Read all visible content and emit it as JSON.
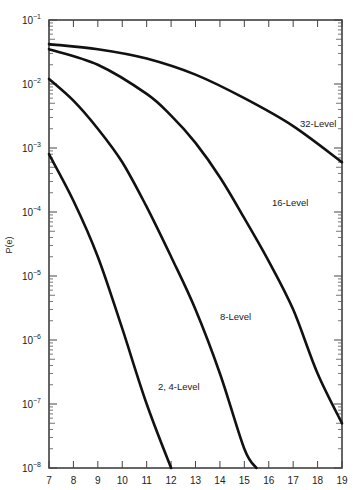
{
  "chart_data": {
    "type": "line",
    "title": "",
    "xlabel": "",
    "ylabel": "P(e)",
    "xlim": [
      7,
      19
    ],
    "ylim": [
      1e-08,
      0.1
    ],
    "yscale": "log",
    "grid": false,
    "x_ticks": [
      "7",
      "8",
      "9",
      "10",
      "11",
      "12",
      "13",
      "14",
      "15",
      "16",
      "17",
      "18",
      "19"
    ],
    "y_ticks": [
      {
        "base": "10",
        "exp": "−1",
        "value": -1
      },
      {
        "base": "10",
        "exp": "−2",
        "value": -2
      },
      {
        "base": "10",
        "exp": "−3",
        "value": -3
      },
      {
        "base": "10",
        "exp": "−4",
        "value": -4
      },
      {
        "base": "10",
        "exp": "−5",
        "value": -5
      },
      {
        "base": "10",
        "exp": "−6",
        "value": -6
      },
      {
        "base": "10",
        "exp": "−7",
        "value": -7
      },
      {
        "base": "10",
        "exp": "−8",
        "value": -8
      }
    ],
    "series": [
      {
        "name": "32-Level",
        "label_pos": [
          300,
          127
        ],
        "points": [
          [
            7,
            0.042
          ],
          [
            9,
            0.035
          ],
          [
            11,
            0.025
          ],
          [
            13,
            0.014
          ],
          [
            15,
            0.006
          ],
          [
            17,
            0.0022
          ],
          [
            19,
            0.0006
          ]
        ]
      },
      {
        "name": "16-Level",
        "label_pos": [
          272,
          206
        ],
        "points": [
          [
            7,
            0.035
          ],
          [
            9,
            0.02
          ],
          [
            11,
            0.007
          ],
          [
            12,
            0.0032
          ],
          [
            13,
            0.0012
          ],
          [
            14,
            0.00035
          ],
          [
            15,
            8e-05
          ],
          [
            16,
            1.7e-05
          ],
          [
            17,
            3e-06
          ],
          [
            18,
            3e-07
          ],
          [
            19,
            5e-08
          ]
        ]
      },
      {
        "name": "8-Level",
        "label_pos": [
          220,
          320
        ],
        "points": [
          [
            7,
            0.012
          ],
          [
            8,
            0.0055
          ],
          [
            9,
            0.002
          ],
          [
            10,
            0.0006
          ],
          [
            11,
            0.00012
          ],
          [
            12,
            2e-05
          ],
          [
            13,
            3e-06
          ],
          [
            14,
            3e-07
          ],
          [
            15,
            2e-08
          ],
          [
            15.5,
            1e-08
          ]
        ]
      },
      {
        "name": "2, 4-Level",
        "label_pos": [
          158,
          390
        ],
        "points": [
          [
            7,
            0.0008
          ],
          [
            8,
            0.00015
          ],
          [
            9,
            2e-05
          ],
          [
            10,
            1.5e-06
          ],
          [
            11,
            1e-07
          ],
          [
            12,
            1e-08
          ]
        ]
      }
    ]
  }
}
